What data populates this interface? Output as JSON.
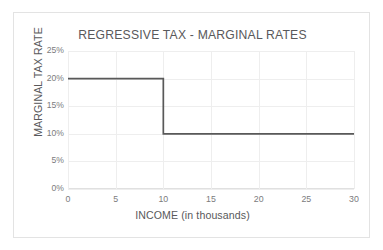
{
  "chart_data": {
    "type": "line",
    "title": "REGRESSIVE TAX - MARGINAL RATES",
    "xlabel": "INCOME (in thousands)",
    "ylabel": "MARGINAL TAX RATE",
    "xlim": [
      0,
      30
    ],
    "ylim": [
      0,
      25
    ],
    "grid": true,
    "legend": false,
    "x_ticks": [
      "0",
      "5",
      "10",
      "15",
      "20",
      "25",
      "30"
    ],
    "x_tick_values": [
      0,
      5,
      10,
      15,
      20,
      25,
      30
    ],
    "y_ticks": [
      "0%",
      "5%",
      "10%",
      "15%",
      "20%",
      "25%"
    ],
    "y_tick_values": [
      0,
      5,
      10,
      15,
      20,
      25
    ],
    "series": [
      {
        "name": "Marginal tax rate",
        "step": "post",
        "color": "#595959",
        "x": [
          0,
          10,
          10,
          30
        ],
        "values": [
          20,
          20,
          10,
          10
        ]
      }
    ],
    "annotations": []
  },
  "figure": {
    "title": "REGRESSIVE TAX - MARGINAL RATES",
    "x_axis_title": "INCOME (in thousands)",
    "y_axis_title": "MARGINAL TAX RATE",
    "colors": {
      "data_line": "#595959",
      "gridline": "#eeeeee",
      "text": "#59595b",
      "tick_text": "#7b7b7d",
      "border": "#e3e3e3",
      "background": "#ffffff"
    }
  }
}
